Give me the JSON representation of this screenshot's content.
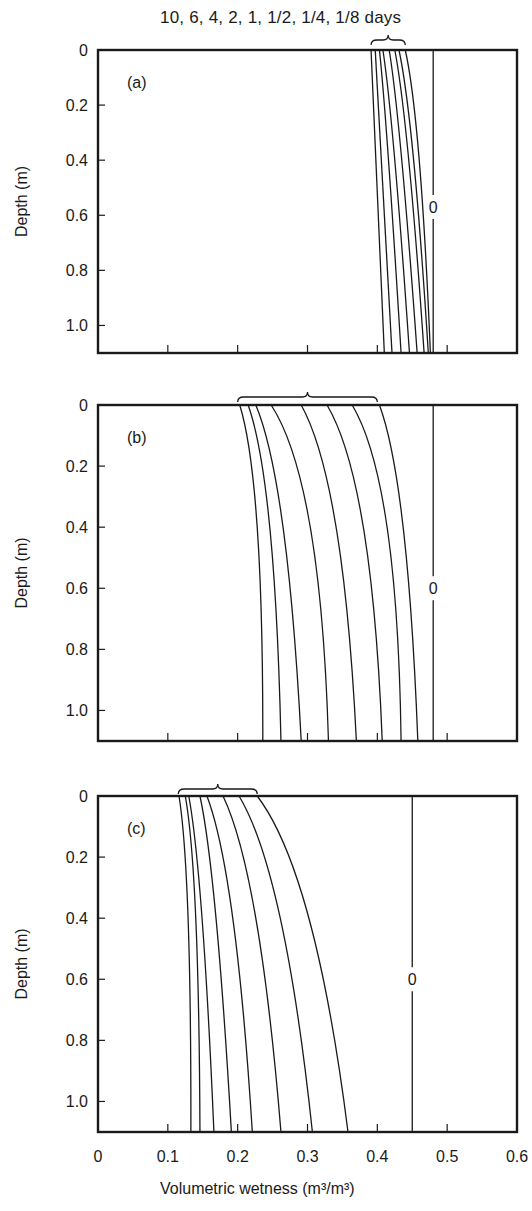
{
  "header": {
    "days_label": "10, 6, 4, 2, 1, 1/2, 1/4, 1/8 days"
  },
  "xaxis": {
    "label": "Volumetric wetness (m³/m³)",
    "ticks": [
      "0",
      "0.1",
      "0.2",
      "0.3",
      "0.4",
      "0.5",
      "0.6"
    ]
  },
  "yaxis": {
    "label": "Depth (m)",
    "ticks": [
      "0",
      "0.2",
      "0.4",
      "0.6",
      "0.8",
      "1.0"
    ]
  },
  "chart_data": [
    {
      "type": "line",
      "panel": "(a)",
      "title": "",
      "xlabel": "Volumetric wetness (m3/m3)",
      "ylabel": "Depth (m)",
      "xlim": [
        0,
        0.6
      ],
      "ylim": [
        1.1,
        0
      ],
      "grid": false,
      "legend": "brace label above panel: 10, 6, 4, 2, 1, 1/2, 1/4, 1/8 days",
      "depth": [
        0,
        0.4,
        1.1
      ],
      "series": [
        {
          "name": "10 days",
          "values": [
            0.391,
            0.398,
            0.41
          ]
        },
        {
          "name": "6 days",
          "values": [
            0.397,
            0.406,
            0.421
          ]
        },
        {
          "name": "4 days",
          "values": [
            0.403,
            0.416,
            0.434
          ]
        },
        {
          "name": "2 days",
          "values": [
            0.408,
            0.425,
            0.446
          ]
        },
        {
          "name": "1 day",
          "values": [
            0.417,
            0.435,
            0.457
          ]
        },
        {
          "name": "1/2 day",
          "values": [
            0.425,
            0.445,
            0.467
          ]
        },
        {
          "name": "1/4 day",
          "values": [
            0.431,
            0.452,
            0.473
          ]
        },
        {
          "name": "1/8 day",
          "values": [
            0.44,
            0.46,
            0.476
          ]
        },
        {
          "name": "0",
          "values": [
            0.48,
            0.48,
            0.48
          ]
        }
      ],
      "annotations": [
        {
          "text": "0",
          "x": 0.48,
          "depth": 0.57
        }
      ]
    },
    {
      "type": "line",
      "panel": "(b)",
      "title": "",
      "xlabel": "Volumetric wetness (m3/m3)",
      "ylabel": "Depth (m)",
      "xlim": [
        0,
        0.6
      ],
      "ylim": [
        1.1,
        0
      ],
      "grid": false,
      "legend": "brace above panel spanning curves",
      "depth": [
        0,
        0.4,
        1.1
      ],
      "series": [
        {
          "name": "10 days",
          "values": [
            0.203,
            0.228,
            0.236
          ]
        },
        {
          "name": "6 days",
          "values": [
            0.215,
            0.246,
            0.262
          ]
        },
        {
          "name": "4 days",
          "values": [
            0.226,
            0.265,
            0.291
          ]
        },
        {
          "name": "2 days",
          "values": [
            0.248,
            0.304,
            0.33
          ]
        },
        {
          "name": "1 day",
          "values": [
            0.291,
            0.341,
            0.37
          ]
        },
        {
          "name": "1/2 day",
          "values": [
            0.328,
            0.38,
            0.407
          ]
        },
        {
          "name": "1/4 day",
          "values": [
            0.364,
            0.414,
            0.434
          ]
        },
        {
          "name": "1/8 day",
          "values": [
            0.403,
            0.437,
            0.458
          ]
        },
        {
          "name": "0",
          "values": [
            0.48,
            0.48,
            0.48
          ]
        }
      ],
      "annotations": [
        {
          "text": "0",
          "x": 0.48,
          "depth": 0.6
        }
      ]
    },
    {
      "type": "line",
      "panel": "(c)",
      "title": "",
      "xlabel": "Volumetric wetness (m3/m3)",
      "ylabel": "Depth (m)",
      "xlim": [
        0,
        0.6
      ],
      "ylim": [
        1.1,
        0
      ],
      "grid": false,
      "legend": "brace above panel spanning curves",
      "depth": [
        0,
        0.4,
        1.1
      ],
      "series": [
        {
          "name": "10 days",
          "values": [
            0.116,
            0.129,
            0.133
          ]
        },
        {
          "name": "6 days",
          "values": [
            0.125,
            0.14,
            0.146
          ]
        },
        {
          "name": "4 days",
          "values": [
            0.13,
            0.149,
            0.166
          ]
        },
        {
          "name": "2 days",
          "values": [
            0.146,
            0.169,
            0.191
          ]
        },
        {
          "name": "1 day",
          "values": [
            0.156,
            0.193,
            0.221
          ]
        },
        {
          "name": "1/2 day",
          "values": [
            0.179,
            0.226,
            0.262
          ]
        },
        {
          "name": "1/4 day",
          "values": [
            0.202,
            0.261,
            0.307
          ]
        },
        {
          "name": "1/8 day",
          "values": [
            0.228,
            0.302,
            0.358
          ]
        },
        {
          "name": "0",
          "values": [
            0.45,
            0.45,
            0.45
          ]
        }
      ],
      "annotations": [
        {
          "text": "0",
          "x": 0.45,
          "depth": 0.6
        }
      ]
    }
  ],
  "layout": {
    "x0_px": 98,
    "x1_px": 517,
    "panels": [
      {
        "top": 50,
        "bottom": 353,
        "label_y": 88
      },
      {
        "top": 405,
        "bottom": 741,
        "label_y": 443
      },
      {
        "top": 796,
        "bottom": 1132,
        "label_y": 834
      }
    ],
    "braces": [
      {
        "x1": 0.391,
        "x2": 0.44,
        "y": 40
      },
      {
        "x1": 0.2,
        "x2": 0.4,
        "y": 397
      },
      {
        "x1": 0.115,
        "x2": 0.228,
        "y": 789
      }
    ],
    "line_color": "#1a1a1a"
  }
}
